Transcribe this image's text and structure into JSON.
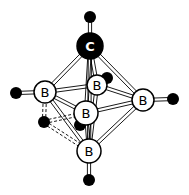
{
  "diagram": {
    "title": "",
    "colors": {
      "bond": "#000000",
      "atom_fill_boron": "#ffffff",
      "atom_fill_carbon": "#000000",
      "hydrogen": "#000000"
    },
    "atoms": [
      {
        "id": "C1",
        "element": "C",
        "label": "C",
        "x": 90,
        "y": 46,
        "r": 13
      },
      {
        "id": "B_left",
        "element": "B",
        "label": "B",
        "x": 45,
        "y": 92,
        "r": 11
      },
      {
        "id": "B_back",
        "element": "B",
        "label": "B",
        "x": 97,
        "y": 85,
        "r": 10
      },
      {
        "id": "B_right",
        "element": "B",
        "label": "B",
        "x": 143,
        "y": 100,
        "r": 11
      },
      {
        "id": "B_front",
        "element": "B",
        "label": "B",
        "x": 86,
        "y": 113,
        "r": 12
      },
      {
        "id": "B_bottom",
        "element": "B",
        "label": "B",
        "x": 89,
        "y": 151,
        "r": 12
      }
    ],
    "hydrogens": [
      {
        "id": "H_top",
        "x": 90,
        "y": 17,
        "r": 6
      },
      {
        "id": "H_left",
        "x": 16,
        "y": 93,
        "r": 6
      },
      {
        "id": "H_right",
        "x": 173,
        "y": 99,
        "r": 6
      },
      {
        "id": "H_back",
        "x": 107,
        "y": 78,
        "r": 6
      },
      {
        "id": "H_front",
        "x": 80,
        "y": 125,
        "r": 6
      },
      {
        "id": "H_bottom",
        "x": 89,
        "y": 180,
        "r": 6
      },
      {
        "id": "H_bridge",
        "x": 44,
        "y": 122,
        "r": 6
      }
    ],
    "bonds": [
      [
        "C1",
        "B_left"
      ],
      [
        "C1",
        "B_back"
      ],
      [
        "C1",
        "B_right"
      ],
      [
        "C1",
        "B_front"
      ],
      [
        "C1",
        "B_bottom"
      ],
      [
        "B_left",
        "B_back"
      ],
      [
        "B_back",
        "B_right"
      ],
      [
        "B_right",
        "B_front"
      ],
      [
        "B_front",
        "B_left"
      ],
      [
        "B_left",
        "B_bottom"
      ],
      [
        "B_back",
        "B_bottom"
      ],
      [
        "B_right",
        "B_bottom"
      ],
      [
        "B_front",
        "B_bottom"
      ],
      [
        "C1",
        "H_top"
      ],
      [
        "B_left",
        "H_left"
      ],
      [
        "B_right",
        "H_right"
      ],
      [
        "B_back",
        "H_back"
      ],
      [
        "B_front",
        "H_front"
      ],
      [
        "B_bottom",
        "H_bottom"
      ]
    ],
    "bridge_bonds": [
      [
        "H_bridge",
        "B_left"
      ],
      [
        "H_bridge",
        "B_front"
      ],
      [
        "H_bridge",
        "B_bottom"
      ]
    ]
  }
}
